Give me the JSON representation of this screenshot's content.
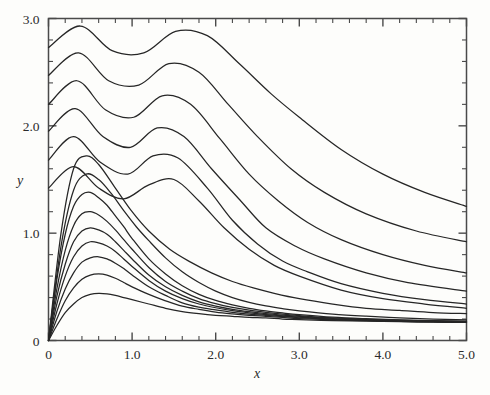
{
  "chart_data": {
    "type": "line",
    "title": "",
    "subtitle": "",
    "xlabel": "x",
    "ylabel": "y",
    "xlim": [
      0.0,
      5.0
    ],
    "ylim": [
      0.0,
      3.0
    ],
    "grid": false,
    "legend": null,
    "legend_position": "none",
    "x_ticks_major": [
      "0",
      "1.0",
      "2.0",
      "3.0",
      "4.0",
      "5.0"
    ],
    "x_ticks_major_values": [
      0.0,
      1.0,
      2.0,
      3.0,
      4.0,
      5.0
    ],
    "x_tick_minor_step": 0.2,
    "y_ticks_major": [
      "0",
      "1.0",
      "2.0",
      "3.0"
    ],
    "y_ticks_major_values": [
      0.0,
      1.0,
      2.0,
      3.0
    ],
    "y_tick_minor_step": 0.2,
    "curve_color": "#262626",
    "axis_color": "#4a4a4a",
    "background_color": "#fdfdfb",
    "n_series": 15,
    "series": [
      {
        "name": "curve-1",
        "y_axis_intercept": 0.0,
        "peak_value": 0.44,
        "peak_x": 0.62,
        "x": [
          0.0,
          0.1,
          0.2,
          0.3,
          0.4,
          0.5,
          0.6,
          0.7,
          0.8,
          0.9,
          1.0,
          1.2,
          1.4,
          1.6,
          1.8,
          2.0,
          2.2,
          2.4,
          2.6,
          2.8,
          3.0,
          3.4,
          3.8,
          4.2,
          4.6,
          5.0
        ],
        "y": [
          0.0,
          0.14,
          0.26,
          0.34,
          0.4,
          0.43,
          0.44,
          0.435,
          0.42,
          0.4,
          0.38,
          0.34,
          0.3,
          0.27,
          0.25,
          0.235,
          0.225,
          0.215,
          0.21,
          0.2,
          0.195,
          0.185,
          0.18,
          0.175,
          0.17,
          0.168
        ]
      },
      {
        "name": "curve-2",
        "y_axis_intercept": 0.0,
        "peak_value": 0.62,
        "peak_x": 0.58,
        "x": [
          0.0,
          0.1,
          0.2,
          0.3,
          0.4,
          0.5,
          0.6,
          0.7,
          0.8,
          0.9,
          1.0,
          1.2,
          1.4,
          1.6,
          1.8,
          2.0,
          2.2,
          2.4,
          2.6,
          2.8,
          3.0,
          3.4,
          3.8,
          4.2,
          4.6,
          5.0
        ],
        "y": [
          0.0,
          0.2,
          0.37,
          0.49,
          0.57,
          0.61,
          0.62,
          0.61,
          0.58,
          0.54,
          0.5,
          0.43,
          0.37,
          0.32,
          0.29,
          0.265,
          0.248,
          0.235,
          0.225,
          0.215,
          0.205,
          0.192,
          0.184,
          0.178,
          0.173,
          0.17
        ]
      },
      {
        "name": "curve-3",
        "y_axis_intercept": 0.0,
        "peak_value": 0.78,
        "peak_x": 0.55,
        "x": [
          0.0,
          0.1,
          0.2,
          0.3,
          0.4,
          0.5,
          0.6,
          0.7,
          0.8,
          0.9,
          1.0,
          1.2,
          1.4,
          1.6,
          1.8,
          2.0,
          2.2,
          2.4,
          2.6,
          2.8,
          3.0,
          3.4,
          3.8,
          4.2,
          4.6,
          5.0
        ],
        "y": [
          0.0,
          0.27,
          0.48,
          0.63,
          0.73,
          0.77,
          0.78,
          0.76,
          0.72,
          0.67,
          0.61,
          0.5,
          0.42,
          0.35,
          0.31,
          0.285,
          0.263,
          0.246,
          0.234,
          0.222,
          0.212,
          0.196,
          0.187,
          0.18,
          0.175,
          0.171
        ]
      },
      {
        "name": "curve-4",
        "y_axis_intercept": 0.0,
        "peak_value": 0.92,
        "peak_x": 0.52,
        "x": [
          0.0,
          0.1,
          0.2,
          0.3,
          0.4,
          0.5,
          0.6,
          0.7,
          0.8,
          0.9,
          1.0,
          1.2,
          1.4,
          1.6,
          1.8,
          2.0,
          2.2,
          2.4,
          2.6,
          2.8,
          3.0,
          3.4,
          3.8,
          4.2,
          4.6,
          5.0
        ],
        "y": [
          0.0,
          0.34,
          0.6,
          0.78,
          0.88,
          0.92,
          0.91,
          0.88,
          0.83,
          0.76,
          0.69,
          0.56,
          0.46,
          0.39,
          0.34,
          0.305,
          0.278,
          0.258,
          0.242,
          0.229,
          0.218,
          0.2,
          0.19,
          0.183,
          0.177,
          0.173
        ]
      },
      {
        "name": "curve-5",
        "y_axis_intercept": 0.0,
        "peak_value": 1.05,
        "peak_x": 0.5,
        "x": [
          0.0,
          0.1,
          0.2,
          0.3,
          0.4,
          0.5,
          0.6,
          0.7,
          0.8,
          0.9,
          1.0,
          1.2,
          1.4,
          1.6,
          1.8,
          2.0,
          2.2,
          2.4,
          2.6,
          2.8,
          3.0,
          3.4,
          3.8,
          4.2,
          4.6,
          5.0
        ],
        "y": [
          0.0,
          0.41,
          0.71,
          0.92,
          1.02,
          1.05,
          1.03,
          0.99,
          0.92,
          0.84,
          0.76,
          0.61,
          0.5,
          0.42,
          0.36,
          0.32,
          0.29,
          0.268,
          0.25,
          0.236,
          0.224,
          0.205,
          0.194,
          0.186,
          0.18,
          0.175
        ]
      },
      {
        "name": "curve-6",
        "y_axis_intercept": 0.0,
        "peak_value": 1.2,
        "peak_x": 0.48,
        "x": [
          0.0,
          0.1,
          0.2,
          0.3,
          0.4,
          0.5,
          0.6,
          0.7,
          0.8,
          0.9,
          1.0,
          1.2,
          1.4,
          1.6,
          1.8,
          2.0,
          2.2,
          2.4,
          2.6,
          2.8,
          3.0,
          3.4,
          3.8,
          4.2,
          4.6,
          5.0
        ],
        "y": [
          0.0,
          0.48,
          0.84,
          1.07,
          1.18,
          1.2,
          1.17,
          1.11,
          1.03,
          0.94,
          0.85,
          0.68,
          0.55,
          0.46,
          0.39,
          0.343,
          0.308,
          0.282,
          0.262,
          0.245,
          0.232,
          0.21,
          0.198,
          0.189,
          0.182,
          0.177
        ]
      },
      {
        "name": "curve-7",
        "y_axis_intercept": 0.0,
        "peak_value": 1.38,
        "peak_x": 0.46,
        "x": [
          0.0,
          0.1,
          0.2,
          0.3,
          0.4,
          0.5,
          0.6,
          0.7,
          0.8,
          0.9,
          1.0,
          1.2,
          1.4,
          1.6,
          1.8,
          2.0,
          2.2,
          2.4,
          2.6,
          2.8,
          3.0,
          3.4,
          3.8,
          4.2,
          4.6,
          5.0
        ],
        "y": [
          0.0,
          0.57,
          0.99,
          1.25,
          1.36,
          1.38,
          1.33,
          1.26,
          1.16,
          1.06,
          0.95,
          0.76,
          0.62,
          0.51,
          0.43,
          0.373,
          0.332,
          0.3,
          0.276,
          0.257,
          0.241,
          0.217,
          0.203,
          0.193,
          0.185,
          0.18
        ]
      },
      {
        "name": "curve-8",
        "y_axis_intercept": 0.0,
        "peak_value": 1.55,
        "peak_x": 0.44,
        "x": [
          0.0,
          0.15,
          0.3,
          0.45,
          0.6,
          0.75,
          0.9,
          1.05,
          1.2,
          1.4,
          1.6,
          1.8,
          2.0,
          2.2,
          2.4,
          2.6,
          2.8,
          3.0,
          3.4,
          3.8,
          4.2,
          4.6,
          5.0
        ],
        "y": [
          0.0,
          0.88,
          1.4,
          1.55,
          1.5,
          1.37,
          1.21,
          1.06,
          0.93,
          0.77,
          0.64,
          0.54,
          0.46,
          0.4,
          0.355,
          0.322,
          0.297,
          0.277,
          0.246,
          0.226,
          0.211,
          0.2,
          0.192
        ]
      },
      {
        "name": "curve-9",
        "y_axis_intercept": 0.0,
        "peak_value": 1.72,
        "peak_x": 0.42,
        "oscillatory": true,
        "x": [
          0.0,
          0.15,
          0.3,
          0.45,
          0.6,
          0.8,
          1.0,
          1.2,
          1.45,
          1.7,
          1.95,
          2.2,
          2.45,
          2.7,
          3.0,
          3.4,
          3.8,
          4.2,
          4.6,
          5.0
        ],
        "y": [
          0.0,
          1.0,
          1.6,
          1.72,
          1.64,
          1.42,
          1.2,
          1.02,
          0.85,
          0.73,
          0.63,
          0.55,
          0.49,
          0.44,
          0.39,
          0.34,
          0.3,
          0.28,
          0.26,
          0.25
        ]
      },
      {
        "name": "curve-10",
        "y_axis_intercept": 1.42,
        "peak_value": 1.62,
        "peak_x": 0.3,
        "oscillatory": true,
        "x": [
          0.0,
          0.3,
          0.6,
          0.9,
          1.2,
          1.5,
          1.8,
          2.1,
          2.4,
          2.7,
          3.0,
          3.5,
          4.0,
          4.5,
          5.0
        ],
        "y": [
          1.42,
          1.62,
          1.42,
          1.32,
          1.45,
          1.5,
          1.3,
          1.05,
          0.85,
          0.7,
          0.6,
          0.47,
          0.39,
          0.34,
          0.3
        ]
      },
      {
        "name": "curve-11",
        "y_axis_intercept": 1.68,
        "peak_value": 1.9,
        "peak_x": 0.3,
        "oscillatory": true,
        "x": [
          0.0,
          0.3,
          0.62,
          0.95,
          1.25,
          1.55,
          1.9,
          2.2,
          2.5,
          2.8,
          3.1,
          3.5,
          4.0,
          4.5,
          5.0
        ],
        "y": [
          1.68,
          1.9,
          1.66,
          1.55,
          1.72,
          1.7,
          1.42,
          1.12,
          0.9,
          0.74,
          0.64,
          0.53,
          0.44,
          0.38,
          0.34
        ]
      },
      {
        "name": "curve-12",
        "y_axis_intercept": 1.95,
        "peak_value": 2.16,
        "peak_x": 0.32,
        "oscillatory": true,
        "x": [
          0.0,
          0.32,
          0.65,
          0.98,
          1.3,
          1.62,
          1.95,
          2.3,
          2.6,
          2.95,
          3.3,
          3.8,
          4.3,
          5.0
        ],
        "y": [
          1.95,
          2.16,
          1.9,
          1.8,
          1.98,
          1.9,
          1.6,
          1.3,
          1.05,
          0.88,
          0.76,
          0.63,
          0.54,
          0.46
        ]
      },
      {
        "name": "curve-13",
        "y_axis_intercept": 2.2,
        "peak_value": 2.42,
        "peak_x": 0.34,
        "oscillatory": true,
        "x": [
          0.0,
          0.34,
          0.68,
          1.02,
          1.36,
          1.7,
          2.05,
          2.4,
          2.75,
          3.1,
          3.5,
          4.0,
          4.5,
          5.0
        ],
        "y": [
          2.2,
          2.42,
          2.15,
          2.08,
          2.28,
          2.2,
          1.88,
          1.55,
          1.3,
          1.1,
          0.94,
          0.8,
          0.7,
          0.63
        ]
      },
      {
        "name": "curve-14",
        "y_axis_intercept": 2.47,
        "peak_value": 2.68,
        "peak_x": 0.36,
        "oscillatory": true,
        "x": [
          0.0,
          0.36,
          0.72,
          1.08,
          1.44,
          1.8,
          2.15,
          2.5,
          2.9,
          3.3,
          3.8,
          4.4,
          5.0
        ],
        "y": [
          2.47,
          2.68,
          2.42,
          2.38,
          2.58,
          2.5,
          2.2,
          1.9,
          1.6,
          1.38,
          1.18,
          1.02,
          0.92
        ]
      },
      {
        "name": "curve-15",
        "y_axis_intercept": 2.73,
        "peak_value": 2.93,
        "peak_x": 0.38,
        "oscillatory": true,
        "x": [
          0.0,
          0.38,
          0.76,
          1.14,
          1.52,
          1.9,
          2.28,
          2.66,
          3.0,
          3.5,
          4.0,
          4.5,
          5.0
        ],
        "y": [
          2.73,
          2.93,
          2.7,
          2.68,
          2.88,
          2.84,
          2.58,
          2.3,
          2.08,
          1.78,
          1.55,
          1.38,
          1.25
        ]
      }
    ],
    "annotations": []
  }
}
